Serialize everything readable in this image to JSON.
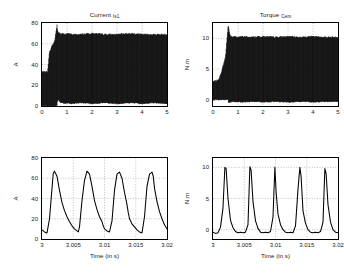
{
  "figure": {
    "background": "#ffffff",
    "foreground": "#000000",
    "grid_color": "#9a9a9a",
    "layout": "2x2"
  },
  "panels": [
    {
      "id": "current-full",
      "title_main": "Current ",
      "title_sub": "Is1",
      "ylabel": "A",
      "xlabel": "",
      "yticks": [
        "0",
        "20",
        "40",
        "60",
        "80"
      ],
      "xticks": [
        "0",
        "1",
        "2",
        "3",
        "4",
        "5"
      ]
    },
    {
      "id": "torque-full",
      "title_main": "Torque ",
      "title_sub": "Cem",
      "ylabel": "N.m",
      "xlabel": "",
      "yticks": [
        "0",
        "5",
        "10"
      ],
      "xticks": [
        "0",
        "1",
        "2",
        "3",
        "4",
        "5"
      ]
    },
    {
      "id": "current-zoom",
      "title_main": "",
      "title_sub": "",
      "ylabel": "A",
      "xlabel": "Time (in s)",
      "yticks": [
        "0",
        "20",
        "40",
        "60",
        "80"
      ],
      "xticks": [
        "3",
        "3.005",
        "3.01",
        "3.015",
        "3.02"
      ]
    },
    {
      "id": "torque-zoom",
      "title_main": "",
      "title_sub": "",
      "ylabel": "N.m",
      "xlabel": "Time (in s)",
      "yticks": [
        "0",
        "5",
        "10"
      ],
      "xticks": [
        "3",
        "3.005",
        "3.01",
        "3.015",
        "3.02"
      ]
    }
  ],
  "chart_data": [
    {
      "type": "area",
      "id": "current-full",
      "title": "Current Is1",
      "xlabel": "",
      "ylabel": "A",
      "xlim": [
        0,
        5
      ],
      "ylim": [
        0,
        80
      ],
      "xticks": [
        0,
        1,
        2,
        3,
        4,
        5
      ],
      "yticks": [
        0,
        20,
        40,
        60,
        80
      ],
      "grid": true,
      "description": "Dense PWM-chopped stator current envelope over full 0-5 s run. Machine starts near t=0.25 s, inrush overshoot peaks about 78 A near t=0.6 s, then settles to a steady ripple band between about 2 A and 69 A.",
      "series": [
        {
          "name": "envelope_upper",
          "x": [
            0,
            0.22,
            0.25,
            0.3,
            0.4,
            0.5,
            0.55,
            0.6,
            0.62,
            0.65,
            0.7,
            0.75,
            0.8,
            0.9,
            1.0,
            1.2,
            1.5,
            2.0,
            2.5,
            3.0,
            3.5,
            4.0,
            4.5,
            5.0
          ],
          "values": [
            33,
            33,
            40,
            52,
            58,
            62,
            70,
            78,
            74,
            70,
            71,
            69,
            70,
            69,
            70,
            69,
            69,
            70,
            69,
            69,
            70,
            69,
            69,
            69
          ]
        },
        {
          "name": "envelope_lower",
          "x": [
            0,
            0.22,
            0.25,
            0.3,
            0.4,
            0.5,
            0.55,
            0.6,
            0.62,
            0.65,
            0.7,
            0.75,
            0.8,
            0.9,
            1.0,
            1.2,
            1.5,
            2.0,
            2.5,
            3.0,
            3.5,
            4.0,
            4.5,
            5.0
          ],
          "values": [
            0,
            0,
            0,
            0,
            0,
            0,
            0,
            0,
            5,
            6,
            4,
            3,
            3,
            2,
            3,
            2,
            3,
            2,
            3,
            2,
            3,
            2,
            3,
            2
          ]
        }
      ]
    },
    {
      "type": "area",
      "id": "torque-full",
      "title": "Torque Cem",
      "xlabel": "",
      "ylabel": "N.m",
      "xlim": [
        0,
        5
      ],
      "ylim": [
        -1,
        12.5
      ],
      "xticks": [
        0,
        1,
        2,
        3,
        4,
        5
      ],
      "yticks": [
        0,
        5,
        10
      ],
      "grid": true,
      "description": "Electromagnetic torque ripple band over full 0-5 s run. Startup transient peaks about 12 N.m near t=0.62 s, then steady pulsating torque between roughly 0 and 10.3 N.m.",
      "series": [
        {
          "name": "envelope_upper",
          "x": [
            0,
            0.2,
            0.3,
            0.4,
            0.5,
            0.55,
            0.6,
            0.62,
            0.65,
            0.7,
            0.8,
            0.9,
            1.0,
            1.2,
            1.5,
            2.0,
            2.5,
            3.0,
            3.5,
            4.0,
            4.5,
            5.0
          ],
          "values": [
            3.0,
            3.2,
            4.0,
            5.5,
            7.0,
            9.5,
            11.8,
            12.1,
            11.0,
            10.4,
            10.2,
            10.3,
            10.2,
            10.3,
            10.2,
            10.3,
            10.2,
            10.3,
            10.2,
            10.3,
            10.2,
            10.2
          ]
        },
        {
          "name": "envelope_lower",
          "x": [
            0,
            0.2,
            0.3,
            0.4,
            0.5,
            0.55,
            0.6,
            0.62,
            0.65,
            0.7,
            0.8,
            0.9,
            1.0,
            1.2,
            1.5,
            2.0,
            2.5,
            3.0,
            3.5,
            4.0,
            4.5,
            5.0
          ],
          "values": [
            0,
            0,
            0,
            0,
            0,
            0,
            0,
            -0.4,
            -0.5,
            -0.4,
            -0.3,
            -0.4,
            -0.3,
            -0.4,
            -0.3,
            -0.4,
            -0.3,
            -0.4,
            -0.3,
            -0.4,
            -0.3,
            -0.3
          ]
        }
      ]
    },
    {
      "type": "line",
      "id": "current-zoom",
      "title": "",
      "xlabel": "Time (in s)",
      "ylabel": "A",
      "xlim": [
        3,
        3.02
      ],
      "ylim": [
        0,
        80
      ],
      "xticks": [
        3,
        3.005,
        3.01,
        3.015,
        3.02
      ],
      "yticks": [
        0,
        20,
        40,
        60,
        80
      ],
      "grid": true,
      "description": "Zoom on stator current over 3 to 3.02 s showing 5 periodic chopped pulses of about 4 ms period; each pulse rises steeply to roughly 67 A then decays back to about 6-10 A.",
      "series": [
        {
          "name": "Is1",
          "x": [
            3.0,
            3.0004,
            3.0008,
            3.0012,
            3.0016,
            3.0018,
            3.002,
            3.0024,
            3.0028,
            3.0032,
            3.0036,
            3.004,
            3.0044,
            3.0048,
            3.0052,
            3.0056,
            3.0058,
            3.006,
            3.0064,
            3.0068,
            3.0072,
            3.0076,
            3.008,
            3.0084,
            3.0088,
            3.0092,
            3.0096,
            3.0098,
            3.01,
            3.0104,
            3.0108,
            3.0112,
            3.0116,
            3.012,
            3.0124,
            3.0128,
            3.0132,
            3.0136,
            3.0138,
            3.014,
            3.0144,
            3.0148,
            3.0152,
            3.0156,
            3.016,
            3.0164,
            3.0168,
            3.0172,
            3.0176,
            3.0178,
            3.018,
            3.0184,
            3.0188,
            3.0192,
            3.0196,
            3.02
          ],
          "values": [
            9,
            7,
            6,
            20,
            50,
            65,
            67,
            62,
            48,
            36,
            28,
            22,
            17,
            13,
            10,
            8,
            7,
            12,
            38,
            58,
            67,
            64,
            52,
            38,
            29,
            22,
            17,
            13,
            10,
            8,
            7,
            18,
            48,
            64,
            66,
            60,
            46,
            34,
            26,
            20,
            15,
            12,
            9,
            7,
            6,
            22,
            52,
            64,
            66,
            62,
            50,
            37,
            27,
            20,
            14,
            10
          ]
        }
      ]
    },
    {
      "type": "line",
      "id": "torque-zoom",
      "title": "",
      "xlabel": "Time (in s)",
      "ylabel": "N.m",
      "xlim": [
        3,
        3.02
      ],
      "ylim": [
        -1.5,
        11.5
      ],
      "xticks": [
        3,
        3.005,
        3.01,
        3.015,
        3.02
      ],
      "yticks": [
        0,
        5,
        10
      ],
      "grid": true,
      "description": "Zoom on electromagnetic torque over 3 to 3.02 s showing 5 narrow spikes of about 4 ms period reaching roughly 10 N.m, with a near-zero slightly negative baseline between spikes.",
      "series": [
        {
          "name": "Cem",
          "x": [
            3.0,
            3.0004,
            3.0008,
            3.0012,
            3.0016,
            3.0019,
            3.0021,
            3.0024,
            3.0028,
            3.0032,
            3.0036,
            3.004,
            3.0044,
            3.0048,
            3.0052,
            3.0056,
            3.0059,
            3.0061,
            3.0064,
            3.0068,
            3.0072,
            3.0076,
            3.008,
            3.0084,
            3.0088,
            3.0092,
            3.0096,
            3.0099,
            3.0101,
            3.0104,
            3.0108,
            3.0112,
            3.0116,
            3.012,
            3.0124,
            3.0128,
            3.0132,
            3.0136,
            3.0139,
            3.0141,
            3.0144,
            3.0148,
            3.0152,
            3.0156,
            3.016,
            3.0164,
            3.0168,
            3.0172,
            3.0176,
            3.0179,
            3.0181,
            3.0184,
            3.0188,
            3.0192,
            3.0196,
            3.02
          ],
          "values": [
            -0.4,
            -0.6,
            -0.5,
            0.4,
            3.5,
            10.0,
            9.8,
            5.0,
            1.5,
            0.3,
            -0.3,
            -0.5,
            -0.4,
            -0.5,
            -0.4,
            0.8,
            10.1,
            9.5,
            4.5,
            1.4,
            0.2,
            -0.4,
            -0.5,
            -0.4,
            -0.5,
            -0.3,
            2.0,
            10.0,
            6.0,
            2.5,
            0.8,
            0.0,
            -0.4,
            -0.5,
            -0.4,
            -0.5,
            0.6,
            6.5,
            10.0,
            8.5,
            3.0,
            1.0,
            0.0,
            -0.4,
            -0.5,
            -0.4,
            -0.5,
            -0.3,
            1.2,
            9.8,
            9.0,
            4.0,
            1.2,
            0.0,
            -0.4,
            -0.5
          ]
        }
      ]
    }
  ]
}
